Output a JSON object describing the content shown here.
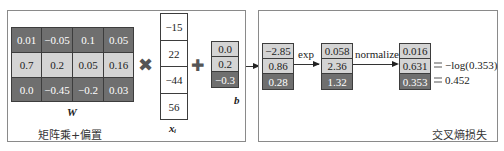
{
  "panels": {
    "left": {
      "caption": "矩阵乘+偏置",
      "weights": {
        "label": "W",
        "rows": [
          {
            "shade": "dark",
            "values": [
              "0.01",
              "−0.05",
              "0.1",
              "0.05"
            ]
          },
          {
            "shade": "light",
            "values": [
              "0.7",
              "0.2",
              "0.05",
              "0.16"
            ]
          },
          {
            "shade": "dark",
            "values": [
              "0.0",
              "−0.45",
              "−0.2",
              "0.03"
            ]
          }
        ]
      },
      "multiply_symbol": "✖",
      "input": {
        "label": "xᵢ",
        "values": [
          "−15",
          "22",
          "−44",
          "56"
        ]
      },
      "plus_symbol": "✚",
      "bias": {
        "label": "b",
        "values": [
          "0.0",
          "0.2",
          "−0.3"
        ]
      }
    },
    "right": {
      "caption": "交叉熵损失",
      "scores": {
        "values": [
          "−2.85",
          "0.86",
          "0.28"
        ]
      },
      "exp_label": "exp",
      "exp_values": {
        "values": [
          "0.058",
          "2.36",
          "1.32"
        ]
      },
      "normalize_label": "normalize",
      "probs": {
        "values": [
          "0.016",
          "0.631",
          "0.353"
        ]
      },
      "loss_expr": "−log(0.353)",
      "loss_value": "0.452"
    }
  },
  "colors": {
    "dark_cell": "#6f6f6f",
    "light_cell": "#d4d4d4",
    "border": "#3d3d3d",
    "frame": "#8a8a8a",
    "operator": "#555555"
  }
}
